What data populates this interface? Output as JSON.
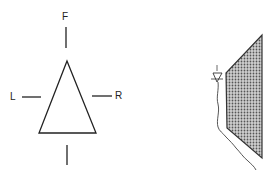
{
  "left_diagram": {
    "labels": {
      "front": "F",
      "left": "L",
      "right": "R"
    }
  },
  "right_diagram": {
    "shaded_region": "stippled-polygon",
    "marker": "triangle-water-level-symbol",
    "line": "wavy-ground-line"
  },
  "colors": {
    "stroke": "#222222",
    "fill": "#9a9a9a"
  }
}
